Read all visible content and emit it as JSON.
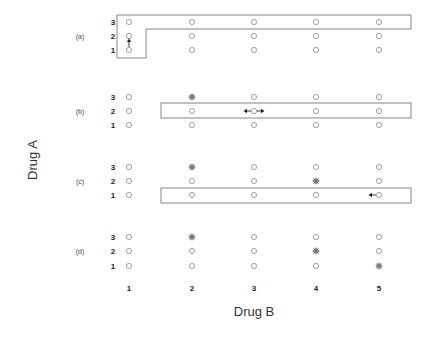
{
  "figure": {
    "y_axis_label": "Drug A",
    "x_axis_label": "Drug B",
    "column_labels": [
      "1",
      "2",
      "3",
      "4",
      "5"
    ],
    "row_labels": [
      "3",
      "2",
      "1"
    ],
    "panels": [
      {
        "label": "(a)",
        "stars": [],
        "box": "L-shape: column 1 rows 1-3 plus row 3 columns 1-5",
        "arrow": "up from (B1,A1)"
      },
      {
        "label": "(b)",
        "stars": [
          [
            2,
            3
          ]
        ],
        "box": "row 2, columns 2-5",
        "arrow": "left and right from (B3,A2)"
      },
      {
        "label": "(c)",
        "stars": [
          [
            2,
            3
          ],
          [
            4,
            2
          ]
        ],
        "box": "row 1, columns 2-5",
        "arrow": "left from (B5,A1)"
      },
      {
        "label": "(d)",
        "stars": [
          [
            2,
            3
          ],
          [
            4,
            2
          ],
          [
            5,
            1
          ]
        ],
        "box": "none",
        "arrow": "none"
      }
    ]
  },
  "colors": {
    "point": "#888888",
    "box": "#777777",
    "arrow": "#222222",
    "text": "#222222"
  }
}
